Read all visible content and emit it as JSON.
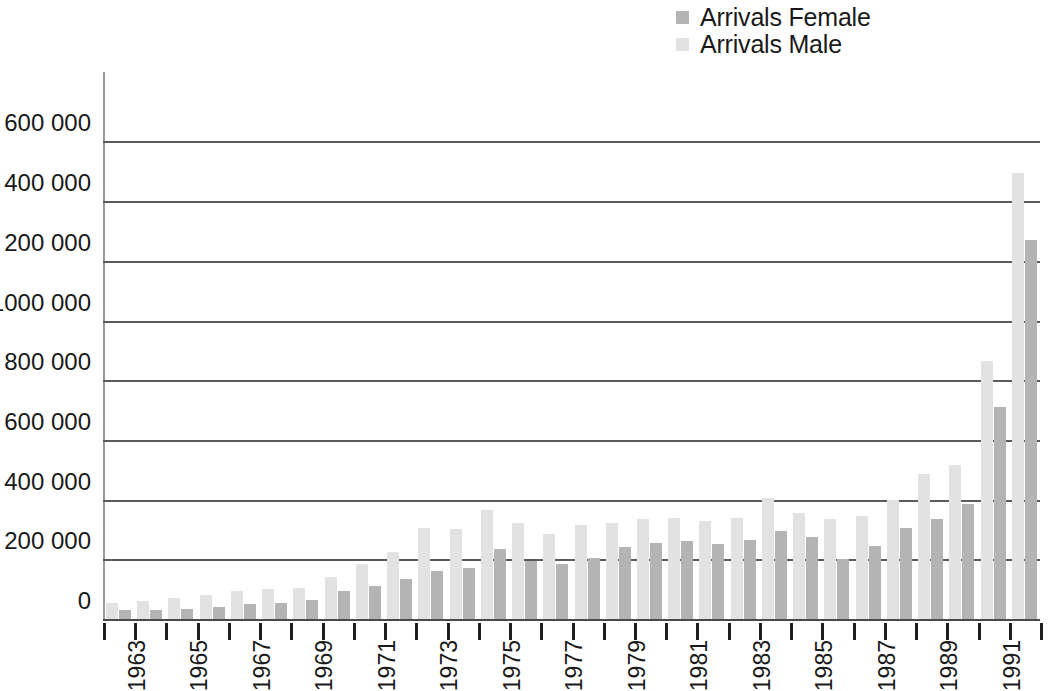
{
  "legend": {
    "position": "top-right",
    "entries": [
      {
        "label": "Arrivals Female",
        "color": "#b4b4b4",
        "key": "female"
      },
      {
        "label": "Arrivals Male",
        "color": "#e2e2e2",
        "key": "male"
      }
    ]
  },
  "axes": {
    "y_tick_labels": [
      "1 600 000",
      "1 400 000",
      "1 200 000",
      "1000 000",
      "800 000",
      "600 000",
      "400 000",
      "200 000",
      "0"
    ],
    "y_tick_values": [
      1600000,
      1400000,
      1200000,
      1000000,
      800000,
      600000,
      400000,
      200000,
      0
    ],
    "x_tick_labels": [
      "1963",
      "1965",
      "1967",
      "1969",
      "1971",
      "1973",
      "1975",
      "1977",
      "1979",
      "1981",
      "1983",
      "1985",
      "1987",
      "1989",
      "1991"
    ],
    "grid": true,
    "ylim": [
      0,
      1600000
    ]
  },
  "chart_data": {
    "type": "bar",
    "title": "",
    "subtitle": "",
    "xlabel": "",
    "ylabel": "",
    "ylim": [
      0,
      1600000
    ],
    "grid": true,
    "legend_position": "top-right",
    "bar_order_in_group": [
      "male",
      "female"
    ],
    "categories": [
      "1963",
      "1964",
      "1965",
      "1966",
      "1967",
      "1968",
      "1969",
      "1970",
      "1971",
      "1972",
      "1973",
      "1974",
      "1975",
      "1976",
      "1977",
      "1978",
      "1979",
      "1980",
      "1981",
      "1982",
      "1983",
      "1984",
      "1985",
      "1986",
      "1987",
      "1988",
      "1989",
      "1990",
      "1991",
      "1992"
    ],
    "series": [
      {
        "name": "Arrivals Male",
        "color": "#e2e2e2",
        "values": [
          55000,
          60000,
          70000,
          80000,
          95000,
          100000,
          105000,
          140000,
          185000,
          225000,
          305000,
          300000,
          365000,
          320000,
          285000,
          315000,
          320000,
          335000,
          340000,
          330000,
          340000,
          405000,
          355000,
          335000,
          345000,
          400000,
          485000,
          515000,
          865000,
          1495000
        ]
      },
      {
        "name": "Arrivals Female",
        "color": "#b4b4b4",
        "values": [
          30000,
          30000,
          35000,
          40000,
          50000,
          55000,
          65000,
          95000,
          110000,
          135000,
          160000,
          170000,
          235000,
          195000,
          185000,
          205000,
          240000,
          255000,
          260000,
          250000,
          265000,
          295000,
          275000,
          200000,
          245000,
          305000,
          335000,
          385000,
          710000,
          1270000
        ]
      }
    ]
  }
}
